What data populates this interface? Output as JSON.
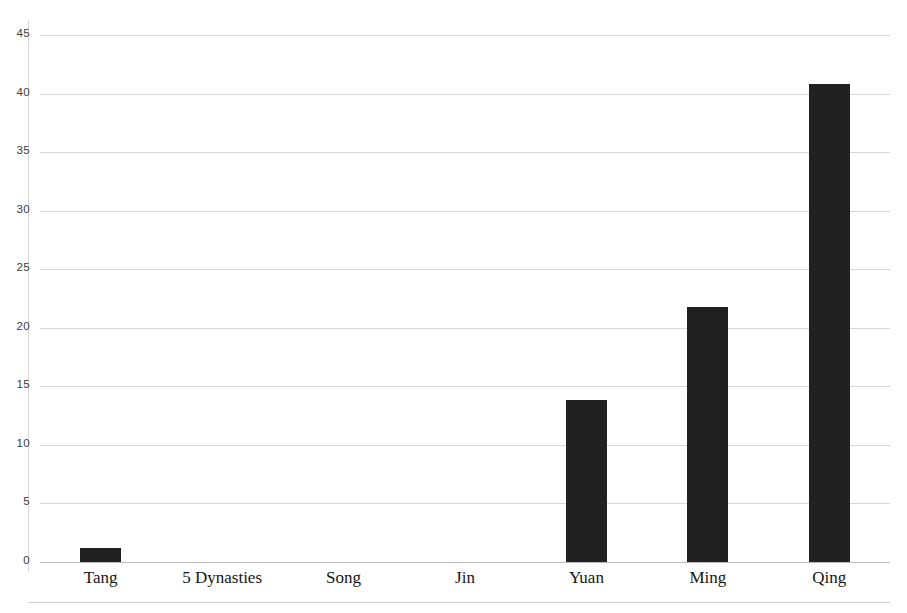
{
  "chart_data": {
    "type": "bar",
    "title": "",
    "xlabel": "",
    "ylabel": "",
    "categories": [
      "Tang",
      "5 Dynasties",
      "Song",
      "Jin",
      "Yuan",
      "Ming",
      "Qing"
    ],
    "values": [
      1.2,
      0,
      0,
      0,
      13.8,
      21.8,
      40.8
    ],
    "ylim": [
      0,
      45
    ],
    "yticks": [
      0,
      5,
      10,
      15,
      20,
      25,
      30,
      35,
      40,
      45
    ],
    "ytick_labels": [
      "0",
      "5",
      "10",
      "15",
      "20",
      "25",
      "30",
      "35",
      "40",
      "45"
    ],
    "grid": true,
    "legend": "none",
    "bar_color": "#212121",
    "gridline_color": "#d6d6d6",
    "axis_color": "#bcbcbc",
    "tick_label_color": "#3d3d3d"
  }
}
